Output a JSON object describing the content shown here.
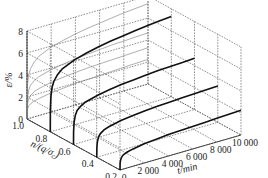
{
  "chart_data": {
    "type": "line",
    "subtype": "3d-line",
    "title": "",
    "axes": {
      "z": {
        "label": "ε/%",
        "ticks": [
          0,
          2,
          4,
          6,
          8
        ],
        "range": [
          0,
          8
        ]
      },
      "y": {
        "label": "n/(q/σc)",
        "ticks": [
          1.0,
          0.8,
          0.6,
          0.4,
          0.2
        ],
        "range": [
          0.2,
          1.0
        ]
      },
      "x": {
        "label": "t/min",
        "ticks": [
          0,
          2000,
          4000,
          6000,
          8000,
          10000
        ],
        "tick_labels": [
          "0",
          "2 000",
          "4 000",
          "6 000",
          "8 000",
          "10 000"
        ],
        "range": [
          0,
          10000
        ]
      }
    },
    "grid": true,
    "t": [
      0,
      10,
      50,
      150,
      300,
      600,
      1000,
      2000,
      3000,
      4000,
      5000,
      6000,
      7000,
      8000,
      9000,
      10000
    ],
    "series": [
      {
        "name": "n=0.8",
        "n": 0.8,
        "style": "bold",
        "t_end": 10000,
        "values": [
          0,
          2.0,
          3.2,
          4.0,
          4.5,
          5.0,
          5.4,
          5.9,
          6.2,
          6.45,
          6.65,
          6.8,
          6.95,
          7.1,
          7.2,
          7.3
        ]
      },
      {
        "name": "n=0.6",
        "n": 0.6,
        "style": "bold",
        "t_end": 10000,
        "values": [
          0,
          1.2,
          2.0,
          2.6,
          3.0,
          3.3,
          3.55,
          3.85,
          4.05,
          4.2,
          4.3,
          4.4,
          4.5,
          4.55,
          4.6,
          4.65
        ]
      },
      {
        "name": "n=0.4",
        "n": 0.4,
        "style": "bold",
        "t_end": 10000,
        "values": [
          0,
          0.9,
          1.4,
          1.8,
          2.05,
          2.3,
          2.45,
          2.7,
          2.85,
          2.95,
          3.05,
          3.1,
          3.15,
          3.2,
          3.25,
          3.3
        ]
      },
      {
        "name": "n=0.2",
        "n": 0.2,
        "style": "bold",
        "t_end": 10000,
        "values": [
          0,
          0.6,
          0.9,
          1.15,
          1.3,
          1.45,
          1.55,
          1.75,
          1.85,
          1.95,
          2.0,
          2.05,
          2.1,
          2.15,
          2.2,
          2.25
        ]
      }
    ],
    "projections_on_back_wall": [
      {
        "name": "proj n=0.8",
        "values": [
          0,
          2.0,
          3.2,
          4.0,
          4.5,
          5.0,
          5.4,
          5.9,
          6.2,
          6.45,
          6.65,
          6.8,
          6.95,
          7.1,
          7.2,
          7.3
        ]
      },
      {
        "name": "proj n=0.6",
        "values": [
          0,
          1.2,
          2.0,
          2.6,
          3.0,
          3.3,
          3.55,
          3.85,
          4.05,
          4.2,
          4.3,
          4.4,
          4.5,
          4.55,
          4.6,
          4.65
        ]
      },
      {
        "name": "proj n=0.4",
        "values": [
          0,
          0.9,
          1.4,
          1.8,
          2.05,
          2.3,
          2.45,
          2.7,
          2.85,
          2.95,
          3.05,
          3.1,
          3.15,
          3.2,
          3.25,
          3.3
        ]
      },
      {
        "name": "proj n=0.2",
        "values": [
          0,
          0.6,
          0.9,
          1.15,
          1.3,
          1.45,
          1.55,
          1.75,
          1.85,
          1.95,
          2.0,
          2.05,
          2.1,
          2.15,
          2.2,
          2.25
        ]
      }
    ],
    "legend": null
  },
  "labels": {
    "z_axis": "ε/%",
    "y_axis": "n/(q/σ",
    "y_axis_sub": "c",
    "y_axis_close": ")",
    "x_axis": "t/min"
  }
}
